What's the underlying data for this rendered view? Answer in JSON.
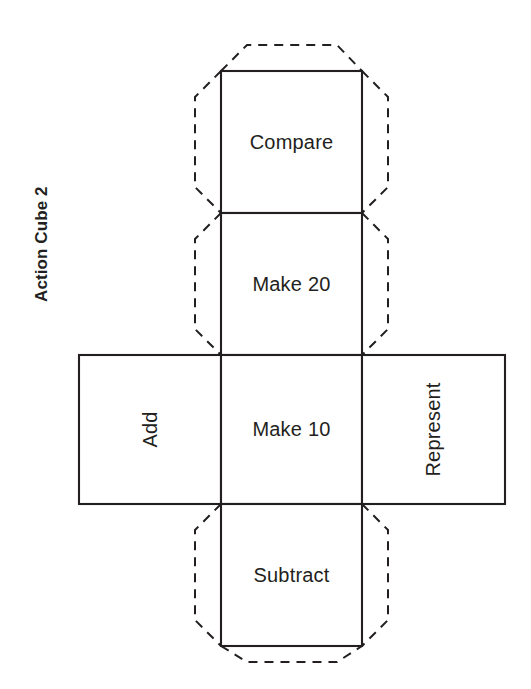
{
  "diagram": {
    "title": "Action Cube 2",
    "type": "cube-net",
    "title_orientation": "rotated-90-ccw",
    "ink_color": "#231f20",
    "background_color": "#ffffff",
    "face_edge_style": "solid",
    "glue_tab_style": "dashed",
    "grid": {
      "columns": 3,
      "rows": 4,
      "cell_size_px": 142,
      "origin_x_px": 79,
      "origin_y_px": 71
    },
    "faces": [
      {
        "id": "compare",
        "label": "Compare",
        "row": 0,
        "column": 1,
        "orientation": "horizontal",
        "has_glue_tabs": true,
        "glue_tab_sides": [
          "top",
          "left",
          "right"
        ]
      },
      {
        "id": "make-20",
        "label": "Make 20",
        "row": 1,
        "column": 1,
        "orientation": "horizontal",
        "has_glue_tabs": true,
        "glue_tab_sides": [
          "left",
          "right"
        ]
      },
      {
        "id": "add",
        "label": "Add",
        "row": 2,
        "column": 0,
        "orientation": "rotated-90-ccw",
        "has_glue_tabs": false,
        "glue_tab_sides": []
      },
      {
        "id": "make-10",
        "label": "Make 10",
        "row": 2,
        "column": 1,
        "orientation": "horizontal",
        "has_glue_tabs": false,
        "glue_tab_sides": []
      },
      {
        "id": "represent",
        "label": "Represent",
        "row": 2,
        "column": 2,
        "orientation": "rotated-90-ccw",
        "has_glue_tabs": false,
        "glue_tab_sides": []
      },
      {
        "id": "subtract",
        "label": "Subtract",
        "row": 3,
        "column": 1,
        "orientation": "horizontal",
        "has_glue_tabs": true,
        "glue_tab_sides": [
          "left",
          "right",
          "bottom"
        ]
      }
    ]
  }
}
